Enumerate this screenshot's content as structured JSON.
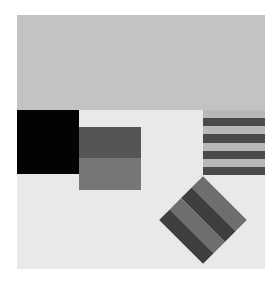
{
  "composition": {
    "background": "#ffffff",
    "canvas_color": "#e9e9e9",
    "sky_color": "#c3c3c3",
    "black_block_color": "#030303",
    "mid_block": {
      "top_color": "#555555",
      "bottom_color": "#767676"
    },
    "stripe_block": {
      "stripes": [
        {
          "color": "#b8b8b8"
        },
        {
          "color": "#4a4a4a"
        },
        {
          "color": "#b8b8b8"
        },
        {
          "color": "#4a4a4a"
        },
        {
          "color": "#b8b8b8"
        },
        {
          "color": "#4a4a4a"
        },
        {
          "color": "#b8b8b8"
        },
        {
          "color": "#4a4a4a"
        }
      ]
    },
    "diamond": {
      "rotation_deg": 45,
      "bands": [
        {
          "color": "#6e6e6e"
        },
        {
          "color": "#3e3e3e"
        },
        {
          "color": "#6e6e6e"
        },
        {
          "color": "#3e3e3e"
        }
      ]
    }
  }
}
